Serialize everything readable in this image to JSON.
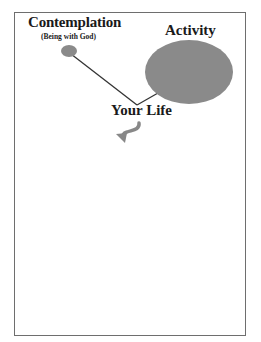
{
  "diagram": {
    "nodes": {
      "contemplation": {
        "title": "Contemplation",
        "subtitle": "(Being with God)"
      },
      "activity": {
        "title": "Activity"
      },
      "life": {
        "title": "Your Life"
      }
    },
    "colors": {
      "ellipse_fill": "#8a8a8a",
      "line": "#333333",
      "arrow": "#888888",
      "border": "#6e6e6e",
      "text": "#1a1a1a"
    },
    "edges": [
      {
        "from": "contemplation",
        "to": "life"
      },
      {
        "from": "activity",
        "to": "life"
      }
    ],
    "arrow_icon": "curved-arrow-down-left"
  }
}
